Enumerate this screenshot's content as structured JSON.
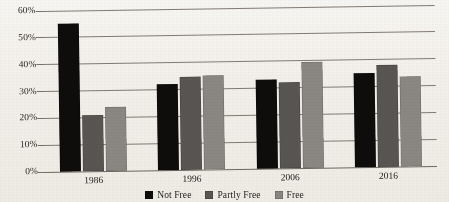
{
  "chart_data": {
    "type": "bar",
    "title": "",
    "subtitle": "",
    "xlabel": "",
    "ylabel": "",
    "categories": [
      "1986",
      "1996",
      "2006",
      "2016"
    ],
    "series": [
      {
        "name": "Not Free",
        "color": "#0e0d0c",
        "values": [
          55,
          32,
          33,
          35
        ]
      },
      {
        "name": "Partly Free",
        "color": "#585552",
        "values": [
          21,
          34.5,
          32,
          38
        ]
      },
      {
        "name": "Free",
        "color": "#8a8783",
        "values": [
          24,
          35,
          39.5,
          33.5
        ]
      }
    ],
    "ylim": [
      0,
      60
    ],
    "ytick_values": [
      0,
      10,
      20,
      30,
      40,
      50,
      60
    ],
    "ytick_labels": [
      "0%",
      "10%",
      "20%",
      "30%",
      "40%",
      "50%",
      "60%"
    ],
    "grid": true,
    "grid_axis": "y",
    "legend_position": "bottom-center",
    "value_format": "percent",
    "background_color": "#f4f2ee"
  },
  "legend": {
    "items": [
      {
        "label": "Not Free"
      },
      {
        "label": "Partly Free"
      },
      {
        "label": "Free"
      }
    ]
  }
}
